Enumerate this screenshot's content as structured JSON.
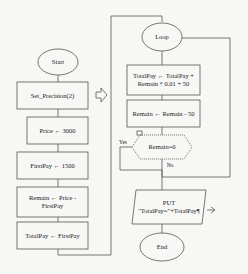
{
  "left_column": {
    "start": "Start",
    "set_precision": "Set_Precision(2)",
    "price": "Price ← 3000",
    "first_pay": "FirstPay ← 1500",
    "remain_line1": "Remain ← Price -",
    "remain_line2": "FirstPay",
    "total_pay": "TotalPay ← FirstPay"
  },
  "right_column": {
    "loop": "Loop",
    "total_update_line1": "TotalPay ← TotalPay +",
    "total_update_line2": "Remain * 0.01 + 50",
    "remain_update": "Remain ← Remain - 50",
    "decision": "Remain=0",
    "yes": "Yes",
    "no": "No",
    "put_line1": "PUT",
    "put_line2": "\"TotalPay=\"+TotalPay¶",
    "end": "End"
  },
  "colors": {
    "stroke": "#555555",
    "fill": "#f7f7f5"
  }
}
